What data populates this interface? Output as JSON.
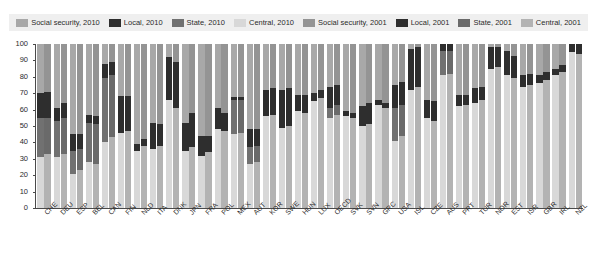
{
  "legend": {
    "position": "top",
    "items": [
      {
        "label": "Social security, 2010",
        "color": "#a8a8a8",
        "name": "social-security-2010"
      },
      {
        "label": "Local, 2010",
        "color": "#2e2e2e",
        "name": "local-2010"
      },
      {
        "label": "State, 2010",
        "color": "#717171",
        "name": "state-2010"
      },
      {
        "label": "Central, 2010",
        "color": "#d8d8d8",
        "name": "central-2010"
      },
      {
        "label": "Social security, 2001",
        "color": "#949494",
        "name": "social-security-2001"
      },
      {
        "label": "Local, 2001",
        "color": "#2e2e2e",
        "name": "local-2001"
      },
      {
        "label": "State, 2001",
        "color": "#6a6a6a",
        "name": "state-2001"
      },
      {
        "label": "Central, 2001",
        "color": "#b3b3b3",
        "name": "central-2001"
      }
    ]
  },
  "chart_data": {
    "type": "bar",
    "title": "",
    "subtitle": "",
    "xlabel": "",
    "ylabel": "",
    "ylim": [
      0,
      100
    ],
    "yticks": [
      0,
      10,
      20,
      30,
      40,
      50,
      60,
      70,
      80,
      90,
      100
    ],
    "grid": false,
    "stacked": true,
    "stack_order_bottom_to_top": [
      "Central",
      "State",
      "Local",
      "Social security"
    ],
    "legend_position": "top",
    "categories": [
      "CHE",
      "DEU",
      "ESP",
      "BEL",
      "CAN",
      "FIN",
      "NLD",
      "ITA",
      "DNK",
      "JPN",
      "FRA",
      "POL",
      "MEX",
      "AUT",
      "KOR",
      "SWE",
      "HUN",
      "LUX",
      "OECD",
      "SVK",
      "SVN",
      "GRC",
      "USA",
      "ISL",
      "CZE",
      "AUS",
      "PRT",
      "TUR",
      "NOR",
      "EST",
      "ISR",
      "GBR",
      "IRL",
      "NZL"
    ],
    "series": [
      {
        "name": "2010",
        "segments": [
          {
            "name": "Central",
            "color": "#d8d8d8",
            "values": [
              31,
              31,
              21,
              28,
              40,
              46,
              35,
              36,
              66,
              35,
              32,
              48,
              45,
              27,
              56,
              49,
              59,
              65,
              55,
              56,
              50,
              63,
              41,
              72,
              55,
              81,
              62,
              64,
              85,
              81,
              74,
              76,
              81,
              95
            ]
          },
          {
            "name": "State",
            "color": "#717171",
            "values": [
              24,
              22,
              14,
              24,
              39,
              0,
              0,
              0,
              0,
              0,
              0,
              0,
              21,
              10,
              0,
              0,
              0,
              0,
              6,
              0,
              0,
              0,
              20,
              0,
              0,
              15,
              0,
              0,
              0,
              0,
              0,
              0,
              0,
              0
            ]
          },
          {
            "name": "Local",
            "color": "#2e2e2e",
            "values": [
              15,
              8,
              10,
              5,
              9,
              22,
              4,
              16,
              26,
              17,
              12,
              13,
              2,
              11,
              16,
              23,
              10,
              5,
              13,
              3,
              12,
              3,
              14,
              25,
              11,
              4,
              7,
              9,
              13,
              15,
              7,
              5,
              4,
              5
            ]
          },
          {
            "name": "Social security",
            "color": "#a8a8a8",
            "values": [
              30,
              39,
              55,
              43,
              12,
              32,
              61,
              48,
              8,
              48,
              56,
              39,
              32,
              52,
              28,
              28,
              31,
              30,
              26,
              41,
              38,
              34,
              25,
              3,
              34,
              0,
              31,
              27,
              2,
              4,
              19,
              19,
              15,
              0
            ]
          }
        ]
      },
      {
        "name": "2001",
        "segments": [
          {
            "name": "Central",
            "color": "#b3b3b3",
            "values": [
              33,
              33,
              23,
              27,
              43,
              47,
              38,
              38,
              61,
              37,
              34,
              47,
              46,
              28,
              57,
              50,
              58,
              67,
              57,
              55,
              51,
              61,
              44,
              74,
              53,
              82,
              63,
              66,
              86,
              79,
              75,
              78,
              83,
              94
            ]
          },
          {
            "name": "State",
            "color": "#6a6a6a",
            "values": [
              22,
              22,
              13,
              24,
              38,
              0,
              0,
              0,
              0,
              0,
              0,
              0,
              20,
              10,
              0,
              0,
              0,
              0,
              6,
              0,
              0,
              0,
              19,
              0,
              0,
              14,
              0,
              0,
              0,
              0,
              0,
              0,
              0,
              0
            ]
          },
          {
            "name": "Local",
            "color": "#2e2e2e",
            "values": [
              16,
              9,
              9,
              5,
              8,
              21,
              4,
              13,
              28,
              21,
              10,
              11,
              2,
              10,
              16,
              23,
              11,
              5,
              12,
              3,
              13,
              3,
              14,
              24,
              12,
              4,
              6,
              8,
              12,
              14,
              7,
              5,
              4,
              6
            ]
          },
          {
            "name": "Social security",
            "color": "#949494",
            "values": [
              29,
              36,
              55,
              44,
              11,
              32,
              58,
              49,
              11,
              42,
              56,
              42,
              32,
              52,
              27,
              27,
              31,
              28,
              25,
              42,
              36,
              36,
              23,
              2,
              35,
              0,
              31,
              26,
              2,
              7,
              18,
              17,
              13,
              0
            ]
          }
        ]
      }
    ]
  }
}
